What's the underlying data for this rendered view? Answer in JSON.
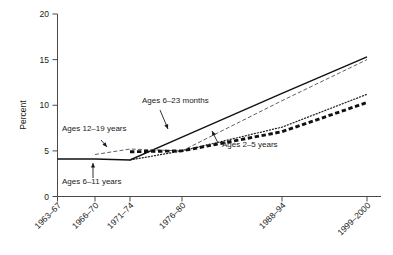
{
  "chart_data": {
    "type": "line",
    "title": "",
    "xlabel": "",
    "ylabel": "Percent",
    "ylim": [
      0,
      20
    ],
    "yticks": [
      0,
      5,
      10,
      15,
      20
    ],
    "ytick_labels": [
      "0",
      "5",
      "10",
      "15",
      "20"
    ],
    "categories": [
      "1963-67",
      "1966-70",
      "1971-74",
      "1976-80",
      "1988-94",
      "1999-2000"
    ],
    "xtick_labels": [
      "1963–67",
      "1966–70",
      "1971–74",
      "1976–80",
      "1988–94",
      "1999–2000"
    ],
    "grid": false,
    "legend": "annotations-inline",
    "series": [
      {
        "name": "Ages 6–11 years",
        "style": "solid",
        "x": [
          "1963-67",
          "1966-70",
          "1971-74",
          "1976-80",
          "1988-94",
          "1999-2000"
        ],
        "values": [
          4.1,
          4.1,
          4.0,
          6.5,
          11.3,
          15.3
        ]
      },
      {
        "name": "Ages 12–19 years",
        "style": "thin-dashed",
        "x": [
          "1966-70",
          "1971-74",
          "1976-80",
          "1988-94",
          "1999-2000"
        ],
        "values": [
          4.6,
          5.2,
          5.0,
          10.5,
          15.0
        ]
      },
      {
        "name": "Ages 6–23 months",
        "style": "dotted",
        "x": [
          "1971-74",
          "1976-80",
          "1988-94",
          "1999-2000"
        ],
        "values": [
          4.0,
          5.0,
          7.6,
          11.2
        ]
      },
      {
        "name": "Ages 2–5 years",
        "style": "thick-dashed",
        "x": [
          "1971-74",
          "1976-80",
          "1988-94",
          "1999-2000"
        ],
        "values": [
          4.9,
          5.0,
          7.1,
          10.3
        ]
      }
    ],
    "annotations": [
      {
        "text": "Ages 12–19 years",
        "target_series": "Ages 12–19 years"
      },
      {
        "text": "Ages 6–11 years",
        "target_series": "Ages 6–11 years"
      },
      {
        "text": "Ages 6–23 months",
        "target_series": "Ages 6–23 months"
      },
      {
        "text": "Ages 2–5 years",
        "target_series": "Ages 2–5 years"
      }
    ]
  }
}
